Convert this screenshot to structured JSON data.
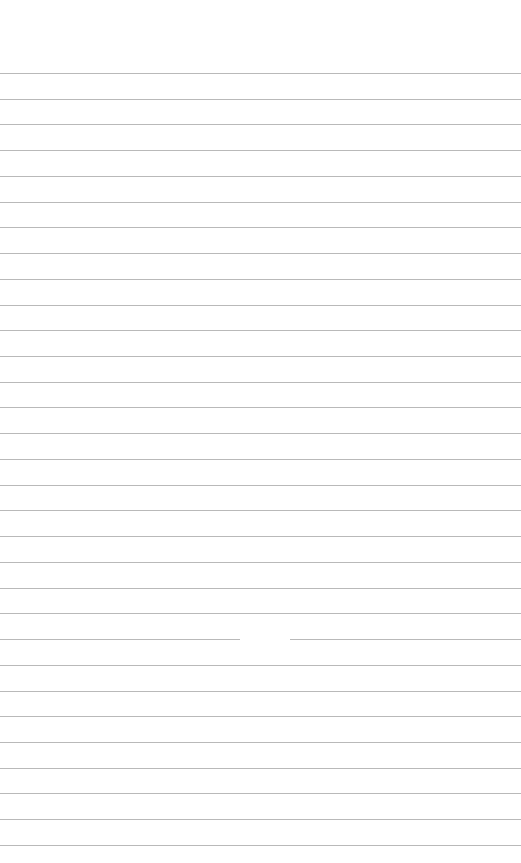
{
  "paper": {
    "type": "lined-paper",
    "background_color": "#ffffff",
    "rule_color": "#b9b9b9",
    "first_rule_y": 73,
    "rule_spacing": 25.73,
    "rule_count": 31,
    "gap": {
      "rule_index": 22,
      "x_start": 240,
      "x_end": 290
    }
  }
}
